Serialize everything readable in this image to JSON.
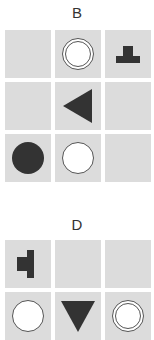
{
  "panels": [
    {
      "label": "B",
      "cells": [
        {
          "shape": "empty"
        },
        {
          "shape": "double-circle"
        },
        {
          "shape": "t-shape-up"
        },
        {
          "shape": "empty"
        },
        {
          "shape": "triangle-left"
        },
        {
          "shape": "empty"
        },
        {
          "shape": "filled-circle"
        },
        {
          "shape": "open-circle"
        },
        {
          "shape": "empty"
        }
      ]
    },
    {
      "label": "D",
      "cells": [
        {
          "shape": "t-shape-left"
        },
        {
          "shape": "empty"
        },
        {
          "shape": "empty"
        },
        {
          "shape": "open-circle"
        },
        {
          "shape": "triangle-down"
        },
        {
          "shape": "double-circle"
        }
      ]
    }
  ],
  "colors": {
    "cell_bg": "#dcdcdc",
    "shape_fill": "#333333",
    "outline": "#555555"
  }
}
